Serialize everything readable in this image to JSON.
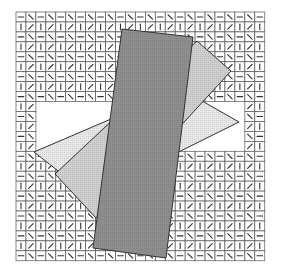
{
  "title": "",
  "colors": {
    "background": "#ffffff",
    "grid_line": "#555555",
    "tick_mark": "#333333",
    "rect_dark": "#8a8a8a",
    "rect_mid": "#c8c8c8",
    "rect_light": "#e8e8e8",
    "outline": "#333333"
  },
  "grid": {
    "left": 16,
    "top": 12,
    "cols": 25,
    "rows": 25,
    "cell": 9.95,
    "hole": {
      "col_start": 2,
      "col_end": 23,
      "row_start": 9,
      "row_end": 14
    },
    "pattern_note": "even rows alternate '-' and '\\\\'; odd rows alternate '|' and '/'"
  },
  "shapes": [
    {
      "name": "light-rectangle",
      "fill": "#e8e8e8",
      "points": [
        [
          34,
          152
        ],
        [
          181,
          89
        ],
        [
          239,
          122
        ],
        [
          90,
          196
        ]
      ]
    },
    {
      "name": "mid-rectangle",
      "fill": "#cfcfcf",
      "points": [
        [
          55,
          174
        ],
        [
          197,
          41
        ],
        [
          231,
          71
        ],
        [
          96,
          218
        ]
      ]
    },
    {
      "name": "dark-rectangle",
      "fill": "#8f8f8f",
      "points": [
        [
          122,
          29
        ],
        [
          193,
          37
        ],
        [
          166,
          258
        ],
        [
          93,
          248
        ]
      ]
    }
  ]
}
